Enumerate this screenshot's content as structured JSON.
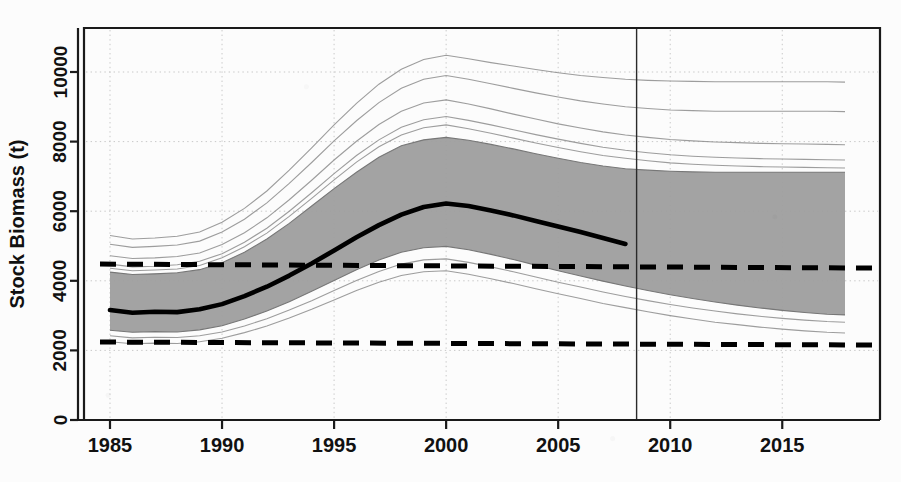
{
  "chart_data": {
    "type": "line",
    "title": "",
    "subtitle": "",
    "xlabel": "",
    "ylabel": "Stock Biomass (t)",
    "xlim": [
      1984.2,
      1917.0
    ],
    "x_axis_range": [
      1984.2,
      2017.8
    ],
    "ylim": [
      0,
      11560
    ],
    "grid": true,
    "legend": null,
    "x_ticks": [
      1985,
      1990,
      1995,
      2000,
      2005,
      2010,
      2015
    ],
    "x_tick_labels": [
      "1985",
      "1990",
      "1995",
      "2000",
      "2005",
      "2010",
      "2015"
    ],
    "y_ticks": [
      0,
      2000,
      4000,
      6000,
      8000,
      10000
    ],
    "y_tick_labels": [
      "0",
      "2000",
      "4000",
      "6000",
      "8000",
      "10000"
    ],
    "annotations": {
      "vertical_line_year": 2008.5,
      "upper_reference_line": 4480,
      "lower_reference_line": 2240,
      "median_line_end_year": 2008.5
    },
    "x": [
      1985,
      1986,
      1987,
      1988,
      1989,
      1990,
      1991,
      1992,
      1993,
      1994,
      1995,
      1996,
      1997,
      1998,
      1999,
      2000,
      2001,
      2002,
      2003,
      2004,
      2005,
      2006,
      2007,
      2008,
      2009,
      2010,
      2011,
      2012,
      2013,
      2014,
      2015,
      2016,
      2017,
      2017.8
    ],
    "series": [
      {
        "name": "median",
        "style": "thick-black-solid",
        "values": [
          3160,
          3080,
          3110,
          3100,
          3180,
          3330,
          3560,
          3830,
          4150,
          4500,
          4870,
          5250,
          5600,
          5900,
          6120,
          6220,
          6150,
          6020,
          5880,
          5720,
          5560,
          5400,
          5230,
          5060,
          null,
          null,
          null,
          null,
          null,
          null,
          null,
          null,
          null,
          null
        ]
      },
      {
        "name": "credible-band-upper",
        "style": "gray-fill-upper",
        "values": [
          4250,
          4180,
          4200,
          4230,
          4320,
          4520,
          4820,
          5200,
          5650,
          6150,
          6650,
          7120,
          7550,
          7880,
          8050,
          8120,
          8040,
          7920,
          7790,
          7650,
          7520,
          7400,
          7300,
          7220,
          7180,
          7150,
          7130,
          7120,
          7120,
          7120,
          7120,
          7120,
          7120,
          7120
        ]
      },
      {
        "name": "credible-band-lower",
        "style": "gray-fill-lower",
        "values": [
          2580,
          2520,
          2540,
          2530,
          2590,
          2710,
          2900,
          3130,
          3400,
          3700,
          4010,
          4320,
          4600,
          4820,
          4950,
          4990,
          4890,
          4760,
          4610,
          4450,
          4290,
          4140,
          3990,
          3850,
          3720,
          3600,
          3490,
          3390,
          3300,
          3220,
          3150,
          3090,
          3040,
          3020
        ]
      },
      {
        "name": "trajectory-1",
        "style": "thin-gray",
        "values": [
          5300,
          5200,
          5230,
          5280,
          5400,
          5680,
          6080,
          6580,
          7180,
          7820,
          8480,
          9100,
          9650,
          10080,
          10360,
          10480,
          10380,
          10270,
          10170,
          10070,
          9980,
          9900,
          9840,
          9790,
          9760,
          9740,
          9730,
          9720,
          9720,
          9720,
          9720,
          9720,
          9720,
          9710
        ]
      },
      {
        "name": "trajectory-2",
        "style": "thin-gray",
        "values": [
          5050,
          4960,
          4990,
          5030,
          5140,
          5400,
          5770,
          6240,
          6800,
          7400,
          8020,
          8600,
          9120,
          9530,
          9790,
          9900,
          9790,
          9660,
          9530,
          9400,
          9280,
          9170,
          9080,
          9000,
          8950,
          8910,
          8890,
          8870,
          8870,
          8870,
          8870,
          8870,
          8870,
          8860
        ]
      },
      {
        "name": "trajectory-3",
        "style": "thin-gray",
        "values": [
          4720,
          4640,
          4660,
          4700,
          4800,
          5040,
          5380,
          5810,
          6330,
          6890,
          7470,
          8010,
          8490,
          8870,
          9110,
          9200,
          9080,
          8940,
          8790,
          8650,
          8510,
          8390,
          8280,
          8190,
          8120,
          8060,
          8020,
          7990,
          7970,
          7950,
          7940,
          7930,
          7920,
          7910
        ]
      },
      {
        "name": "trajectory-4",
        "style": "thin-gray",
        "values": [
          4480,
          4400,
          4420,
          4460,
          4560,
          4780,
          5110,
          5510,
          6000,
          6530,
          7080,
          7600,
          8050,
          8410,
          8630,
          8720,
          8610,
          8480,
          8340,
          8200,
          8070,
          7950,
          7840,
          7750,
          7680,
          7620,
          7580,
          7550,
          7530,
          7510,
          7500,
          7490,
          7480,
          7470
        ]
      },
      {
        "name": "trajectory-5",
        "style": "thin-gray",
        "values": [
          4360,
          4290,
          4310,
          4340,
          4440,
          4660,
          4980,
          5370,
          5850,
          6370,
          6900,
          7410,
          7850,
          8190,
          8400,
          8480,
          8370,
          8240,
          8100,
          7960,
          7830,
          7710,
          7600,
          7520,
          7450,
          7390,
          7350,
          7320,
          7300,
          7280,
          7270,
          7260,
          7250,
          7240
        ]
      },
      {
        "name": "trajectory-6",
        "style": "thin-gray",
        "values": [
          2420,
          2360,
          2380,
          2370,
          2420,
          2530,
          2700,
          2910,
          3160,
          3430,
          3720,
          4010,
          4270,
          4480,
          4600,
          4630,
          4530,
          4400,
          4260,
          4110,
          3960,
          3820,
          3680,
          3550,
          3430,
          3320,
          3220,
          3130,
          3050,
          2980,
          2920,
          2870,
          2830,
          2810
        ]
      },
      {
        "name": "trajectory-7",
        "style": "thin-gray",
        "values": [
          2250,
          2190,
          2210,
          2200,
          2250,
          2350,
          2510,
          2700,
          2930,
          3180,
          3450,
          3720,
          3960,
          4150,
          4260,
          4290,
          4190,
          4060,
          3920,
          3770,
          3630,
          3490,
          3350,
          3230,
          3110,
          3000,
          2900,
          2810,
          2740,
          2670,
          2610,
          2560,
          2520,
          2500
        ]
      }
    ]
  },
  "axis": {
    "y_label": "Stock Biomass (t)"
  },
  "colors": {
    "band": "#9e9e9e",
    "median": "#000000",
    "reference": "#000000",
    "trajectory": "#8c8c8c",
    "grid": "#c8c8c8",
    "axis": "#1a1a1a",
    "background": "#fcfcfc"
  }
}
